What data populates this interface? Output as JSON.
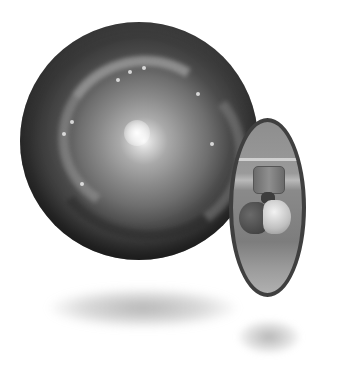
{
  "scene": {
    "description": "Grayscale 3D illustration of a spiral galaxy sphere with an elliptical portal showing an observatory telescope",
    "elements": {
      "galaxy_sphere": {
        "icon": "spiral-galaxy-sphere"
      },
      "portal": {
        "icon": "telescope-portal"
      },
      "shadows": [
        "sphere-shadow",
        "portal-shadow"
      ]
    },
    "colors": {
      "background": "#ffffff",
      "sphere_dark": "#2c2c2c",
      "sphere_core": "#f6f6f6",
      "portal_border": "#3f3f3f",
      "portal_fill": "#9a9a9a"
    }
  }
}
